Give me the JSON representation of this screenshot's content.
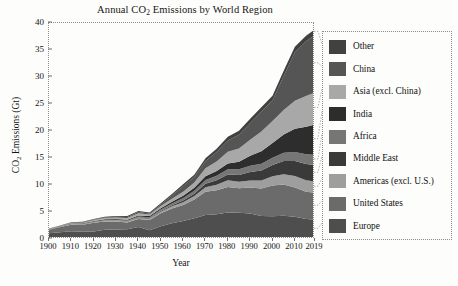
{
  "chart_data": {
    "type": "area",
    "stacked": true,
    "title": "Annual CO2 Emissions by World Region",
    "title_parts": {
      "pre": "Annual CO",
      "sub": "2",
      "post": " Emissions by World Region"
    },
    "xlabel": "Year",
    "ylabel": "CO2 Emissions (Gt)",
    "ylabel_parts": {
      "pre": "CO",
      "sub": "2",
      "post": " Emissions (Gt)"
    },
    "xlim": [
      1900,
      2019
    ],
    "ylim": [
      0,
      40
    ],
    "grid": false,
    "legend_position": "right",
    "x_ticks": [
      1900,
      1910,
      1920,
      1930,
      1940,
      1950,
      1960,
      1970,
      1980,
      1990,
      2000,
      2010,
      2019
    ],
    "y_ticks": [
      0,
      5,
      10,
      15,
      20,
      25,
      30,
      35,
      40
    ],
    "x": [
      1900,
      1905,
      1910,
      1915,
      1920,
      1925,
      1930,
      1935,
      1940,
      1945,
      1950,
      1955,
      1960,
      1965,
      1970,
      1975,
      1980,
      1985,
      1990,
      1995,
      2000,
      2005,
      2010,
      2015,
      2019
    ],
    "series": [
      {
        "name": "Europe",
        "color": "#4e4e4e",
        "values": [
          1.05,
          1.25,
          1.45,
          1.35,
          1.4,
          1.7,
          1.75,
          1.8,
          2.2,
          1.6,
          2.35,
          2.9,
          3.35,
          3.85,
          4.45,
          4.6,
          4.9,
          4.85,
          4.7,
          4.25,
          4.2,
          4.3,
          4.1,
          3.7,
          3.6
        ]
      },
      {
        "name": "United States",
        "color": "#6b6b6b",
        "values": [
          0.66,
          0.95,
          1.2,
          1.3,
          1.6,
          1.55,
          1.5,
          1.25,
          1.5,
          1.9,
          2.4,
          2.75,
          2.95,
          3.45,
          4.3,
          4.45,
          4.75,
          4.55,
          4.85,
          5.1,
          5.7,
          5.8,
          5.45,
          5.05,
          4.95
        ]
      },
      {
        "name": "Americas (excl. U.S.)",
        "color": "#9e9e9e",
        "values": [
          0.03,
          0.05,
          0.08,
          0.09,
          0.12,
          0.15,
          0.16,
          0.17,
          0.2,
          0.24,
          0.3,
          0.4,
          0.52,
          0.65,
          0.85,
          1.0,
          1.25,
          1.2,
          1.3,
          1.5,
          1.7,
          1.9,
          2.1,
          2.15,
          2.1
        ]
      },
      {
        "name": "Middle East",
        "color": "#3a3a3a",
        "values": [
          0.01,
          0.01,
          0.02,
          0.02,
          0.03,
          0.04,
          0.05,
          0.07,
          0.09,
          0.11,
          0.15,
          0.22,
          0.33,
          0.45,
          0.65,
          0.85,
          1.05,
          1.25,
          1.55,
          1.85,
          2.1,
          2.45,
          2.8,
          3.0,
          3.05
        ]
      },
      {
        "name": "Africa",
        "color": "#767676",
        "values": [
          0.03,
          0.04,
          0.05,
          0.06,
          0.08,
          0.1,
          0.12,
          0.14,
          0.17,
          0.19,
          0.25,
          0.32,
          0.42,
          0.52,
          0.68,
          0.8,
          0.95,
          1.05,
          1.15,
          1.25,
          1.35,
          1.5,
          1.65,
          1.8,
          1.9
        ]
      },
      {
        "name": "India",
        "color": "#2d2d2d",
        "values": [
          0.04,
          0.05,
          0.07,
          0.08,
          0.1,
          0.12,
          0.13,
          0.15,
          0.18,
          0.2,
          0.25,
          0.32,
          0.42,
          0.55,
          0.7,
          0.9,
          1.1,
          1.4,
          1.85,
          2.3,
          2.75,
          3.4,
          4.3,
          5.1,
          5.6
        ]
      },
      {
        "name": "Asia (excl. China)",
        "color": "#a8a8a8",
        "values": [
          0.05,
          0.07,
          0.1,
          0.13,
          0.17,
          0.22,
          0.26,
          0.33,
          0.42,
          0.3,
          0.4,
          0.55,
          0.75,
          1.0,
          1.45,
          1.75,
          2.15,
          2.45,
          3.0,
          3.65,
          4.05,
          4.55,
          5.2,
          5.7,
          5.95
        ]
      },
      {
        "name": "China",
        "color": "#555555",
        "values": [
          0.03,
          0.04,
          0.06,
          0.07,
          0.09,
          0.12,
          0.15,
          0.18,
          0.25,
          0.18,
          0.3,
          0.6,
          1.05,
          1.0,
          1.35,
          1.75,
          2.1,
          2.55,
          3.05,
          3.65,
          3.8,
          6.3,
          9.0,
          10.1,
          10.6
        ]
      },
      {
        "name": "Other",
        "color": "#414141",
        "values": [
          0.04,
          0.05,
          0.07,
          0.08,
          0.1,
          0.12,
          0.14,
          0.16,
          0.19,
          0.17,
          0.22,
          0.28,
          0.35,
          0.42,
          0.52,
          0.6,
          0.7,
          0.75,
          0.8,
          0.85,
          0.9,
          0.95,
          1.0,
          1.05,
          1.05
        ]
      }
    ],
    "legend_entries": [
      {
        "label": "Other",
        "color": "#414141"
      },
      {
        "label": "China",
        "color": "#555555"
      },
      {
        "label": "Asia (excl. China)",
        "color": "#a8a8a8"
      },
      {
        "label": "India",
        "color": "#2d2d2d"
      },
      {
        "label": "Africa",
        "color": "#767676"
      },
      {
        "label": "Middle East",
        "color": "#3a3a3a"
      },
      {
        "label": "Americas (excl. U.S.)",
        "color": "#9e9e9e"
      },
      {
        "label": "United States",
        "color": "#6b6b6b"
      },
      {
        "label": "Europe",
        "color": "#4e4e4e"
      }
    ]
  }
}
